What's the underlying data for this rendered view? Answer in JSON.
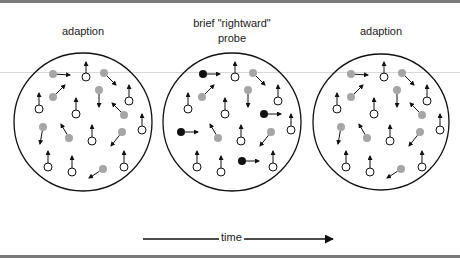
{
  "labels": {
    "left": "adaption",
    "middle_line1": "brief \"rightward\"",
    "middle_line2": "probe",
    "right": "adaption",
    "time": "time"
  },
  "colors": {
    "outline": "#111111",
    "gray_dot": "#a6a6a6",
    "black_dot": "#111111",
    "white_dot": "#ffffff"
  },
  "panels": [
    {
      "name": "adaption-left",
      "cx": 83,
      "cy": 122,
      "r": 69
    },
    {
      "name": "probe-middle",
      "cx": 232,
      "cy": 122,
      "r": 69
    },
    {
      "name": "adaption-right",
      "cx": 381,
      "cy": 122,
      "r": 68
    }
  ],
  "base_particles": [
    {
      "x": -30,
      "y": -48,
      "dx": 17,
      "dy": 1,
      "type": "gray",
      "probe": "black"
    },
    {
      "x": 3,
      "y": -45,
      "dx": 0,
      "dy": -15,
      "type": "white"
    },
    {
      "x": 21,
      "y": -49,
      "dx": 12,
      "dy": 12,
      "type": "gray"
    },
    {
      "x": -30,
      "y": -25,
      "dx": 12,
      "dy": -12,
      "type": "gray"
    },
    {
      "x": 46,
      "y": -21,
      "dx": 0,
      "dy": -16,
      "type": "white"
    },
    {
      "x": 16,
      "y": -32,
      "dx": 0,
      "dy": 17,
      "type": "gray"
    },
    {
      "x": -44,
      "y": -13,
      "dx": 0,
      "dy": -16,
      "type": "white"
    },
    {
      "x": -7,
      "y": -8,
      "dx": 0,
      "dy": -16,
      "type": "white"
    },
    {
      "x": 41,
      "y": -7,
      "dx": -12,
      "dy": -12,
      "type": "gray",
      "probe": "black"
    },
    {
      "x": 59,
      "y": 8,
      "dx": 0,
      "dy": -16,
      "type": "white"
    },
    {
      "x": -40,
      "y": 5,
      "dx": -3,
      "dy": 17,
      "type": "gray",
      "probe": "black"
    },
    {
      "x": -14,
      "y": 16,
      "dx": -8,
      "dy": -14,
      "type": "gray"
    },
    {
      "x": 9,
      "y": 19,
      "dx": 0,
      "dy": -16,
      "type": "white"
    },
    {
      "x": 39,
      "y": 10,
      "dx": -11,
      "dy": 14,
      "type": "gray"
    },
    {
      "x": -35,
      "y": 45,
      "dx": 0,
      "dy": -16,
      "type": "white"
    },
    {
      "x": -11,
      "y": 50,
      "dx": 0,
      "dy": -16,
      "type": "white"
    },
    {
      "x": 41,
      "y": 45,
      "dx": 0,
      "dy": -16,
      "type": "white"
    },
    {
      "x": 20,
      "y": 47,
      "dx": -14,
      "dy": 9,
      "type": "gray",
      "probe": "black"
    }
  ],
  "probe_black_positions": [
    {
      "x": -29,
      "y": -48
    },
    {
      "x": 32,
      "y": -8
    },
    {
      "x": -51,
      "y": 10
    },
    {
      "x": 10,
      "y": 39
    }
  ],
  "time_arrow": {
    "x1": 143,
    "x2": 333,
    "y": 239
  }
}
